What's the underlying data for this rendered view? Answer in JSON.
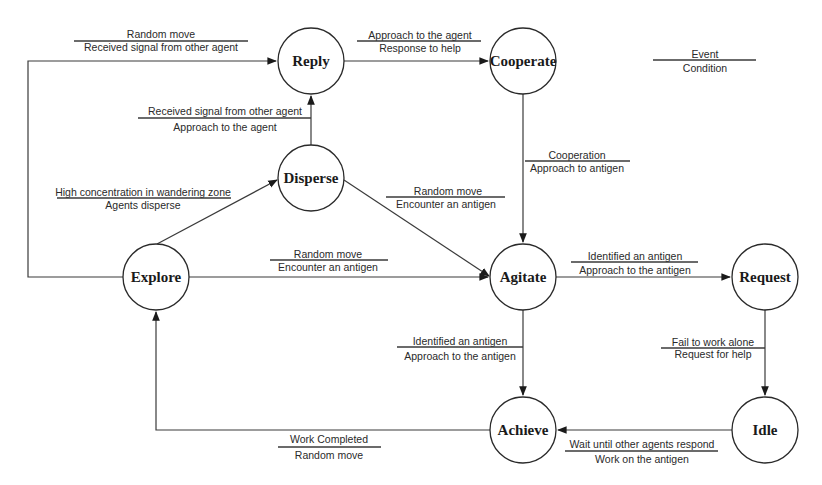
{
  "diagram": {
    "type": "state-transition",
    "legend": {
      "event": "Event",
      "condition": "Condition"
    },
    "states": [
      {
        "id": "reply",
        "label": "Reply"
      },
      {
        "id": "cooperate",
        "label": "Cooperate"
      },
      {
        "id": "disperse",
        "label": "Disperse"
      },
      {
        "id": "explore",
        "label": "Explore"
      },
      {
        "id": "agitate",
        "label": "Agitate"
      },
      {
        "id": "request",
        "label": "Request"
      },
      {
        "id": "achieve",
        "label": "Achieve"
      },
      {
        "id": "idle",
        "label": "Idle"
      }
    ],
    "transitions": [
      {
        "from": "explore",
        "to": "reply",
        "event": "Random move",
        "condition": "Received signal from other agent"
      },
      {
        "from": "reply",
        "to": "cooperate",
        "event": "Approach to the agent",
        "condition": "Response to help"
      },
      {
        "from": "disperse",
        "to": "reply",
        "event": "Received signal from other agent",
        "condition": "Approach to the agent"
      },
      {
        "from": "cooperate",
        "to": "agitate",
        "event": "Cooperation",
        "condition": "Approach to antigen"
      },
      {
        "from": "explore",
        "to": "disperse",
        "event": "High concentration in wandering zone",
        "condition": "Agents disperse"
      },
      {
        "from": "disperse",
        "to": "agitate",
        "event": "Random move",
        "condition": "Encounter an antigen"
      },
      {
        "from": "explore",
        "to": "agitate",
        "event": "Random move",
        "condition": "Encounter an antigen"
      },
      {
        "from": "agitate",
        "to": "request",
        "event": "Identified an antigen",
        "condition": "Approach to the antigen"
      },
      {
        "from": "agitate",
        "to": "achieve",
        "event": "Identified an antigen",
        "condition": "Approach to the antigen"
      },
      {
        "from": "request",
        "to": "idle",
        "event": "Fail to work alone",
        "condition": "Request for help"
      },
      {
        "from": "idle",
        "to": "achieve",
        "event": "Wait until other agents respond",
        "condition": "Work on the antigen"
      },
      {
        "from": "achieve",
        "to": "explore",
        "event": "Work Completed",
        "condition": "Random move"
      }
    ]
  }
}
